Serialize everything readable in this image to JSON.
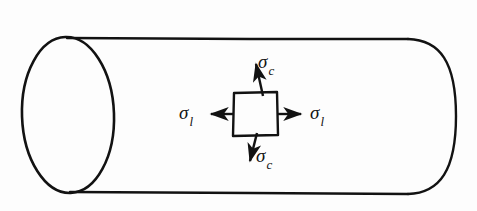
{
  "figure": {
    "name": "thin-walled-cylinder-stress-element",
    "background_color": "#fdfdfd",
    "line_color": "#121212",
    "cylinder": {
      "name": "cylinder-body",
      "left_cap_center_x": 68,
      "left_cap_center_y": 115,
      "left_cap_rx": 46,
      "left_cap_ry": 78,
      "right_cap_center_x": 408,
      "right_cap_center_y": 116,
      "right_cap_rx": 47,
      "right_cap_ry": 78,
      "top_line_y": 39,
      "bottom_line_y": 193
    },
    "stress_element": {
      "name": "stress-element-square",
      "x": 233,
      "y": 92,
      "width": 45,
      "height": 44
    },
    "arrows": [
      {
        "name": "arrow-sigma-c-up",
        "direction": "up",
        "from": [
          262,
          92
        ],
        "to": [
          255,
          60
        ]
      },
      {
        "name": "arrow-sigma-c-down",
        "direction": "down",
        "from": [
          256,
          136
        ],
        "to": [
          249,
          165
        ]
      },
      {
        "name": "arrow-sigma-l-left",
        "direction": "left",
        "from": [
          233,
          114
        ],
        "to": [
          209,
          114
        ]
      },
      {
        "name": "arrow-sigma-l-right",
        "direction": "right",
        "from": [
          278,
          114
        ],
        "to": [
          303,
          114
        ]
      }
    ],
    "labels": {
      "sigma_c_top": {
        "symbol": "σ",
        "subscript": "c"
      },
      "sigma_c_bottom": {
        "symbol": "σ",
        "subscript": "c"
      },
      "sigma_l_left": {
        "symbol": "σ",
        "subscript": "l"
      },
      "sigma_l_right": {
        "symbol": "σ",
        "subscript": "l"
      }
    }
  }
}
